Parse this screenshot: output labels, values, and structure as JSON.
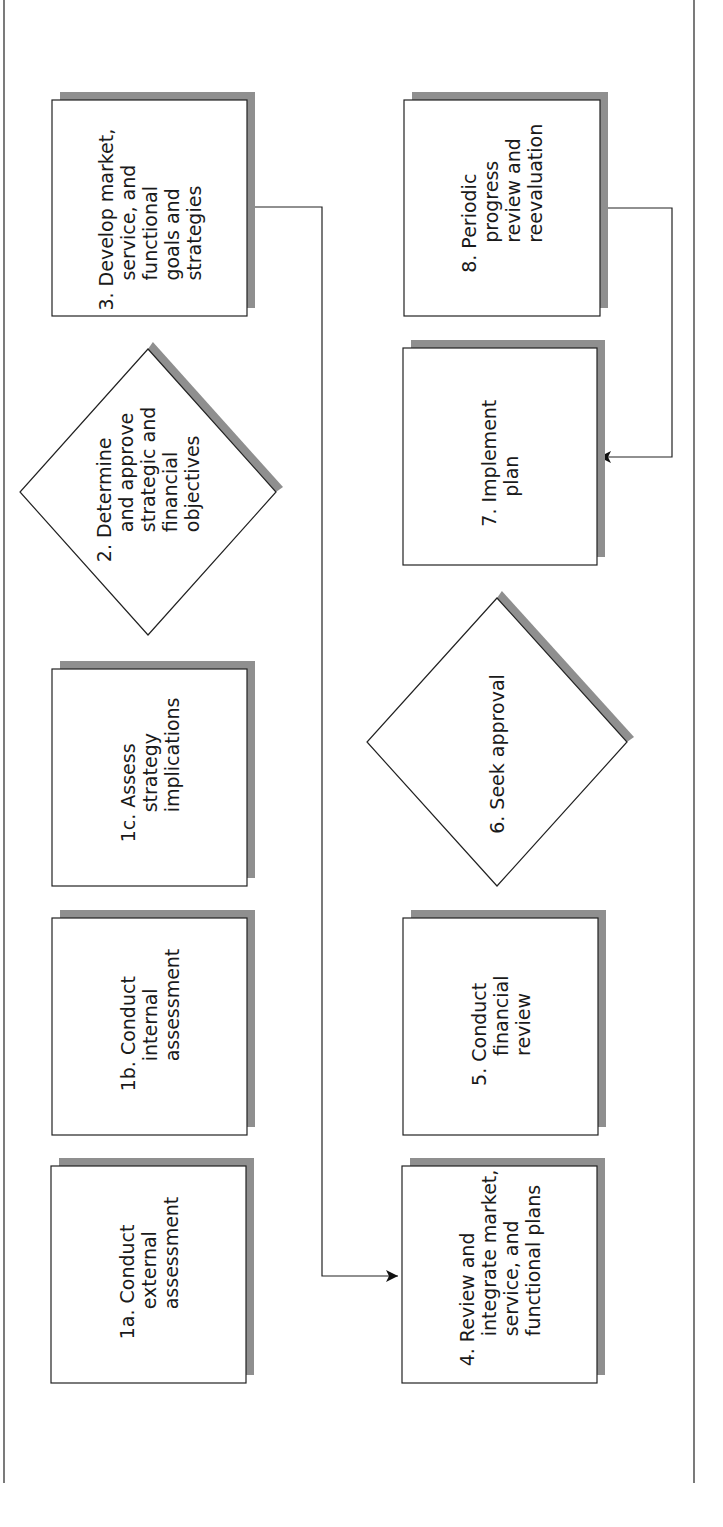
{
  "diagram": {
    "orientation": "rotated-90-ccw",
    "colors": {
      "line": "#222222",
      "shadow": "#8f8f8f",
      "fill": "#ffffff",
      "text": "#1a1a1a"
    },
    "frame": {
      "left_x": 4,
      "right_x": 694,
      "top_y": 0,
      "bottom_y": 1483
    },
    "nodes": [
      {
        "id": "1a",
        "shape": "box",
        "x": 51,
        "y": 1166,
        "w": 195,
        "h": 217,
        "lines": [
          "1a.  Conduct",
          "external",
          "assessment"
        ]
      },
      {
        "id": "1b",
        "shape": "box",
        "x": 52,
        "y": 918,
        "w": 195,
        "h": 217,
        "lines": [
          "1b.  Conduct",
          "internal",
          "assessment"
        ]
      },
      {
        "id": "1c",
        "shape": "box",
        "x": 52,
        "y": 669,
        "w": 195,
        "h": 217,
        "lines": [
          "1c.  Assess",
          "strategy",
          "implications"
        ]
      },
      {
        "id": "2",
        "shape": "diamond",
        "cx": 148,
        "cy": 492,
        "rx": 128,
        "ry": 143,
        "lines": [
          "2.  Determine",
          "and approve",
          "strategic and",
          "financial",
          "objectives"
        ]
      },
      {
        "id": "3",
        "shape": "box",
        "x": 52,
        "y": 100,
        "w": 195,
        "h": 216,
        "lines": [
          "3.  Develop market,",
          "service, and",
          "functional",
          "goals and",
          "strategies"
        ]
      },
      {
        "id": "4",
        "shape": "box",
        "x": 402,
        "y": 1166,
        "w": 195,
        "h": 217,
        "lines": [
          "4.  Review and",
          "integrate market,",
          "service, and",
          "functional plans"
        ]
      },
      {
        "id": "5",
        "shape": "box",
        "x": 403,
        "y": 918,
        "w": 195,
        "h": 217,
        "lines": [
          "5.  Conduct",
          "financial",
          "review"
        ]
      },
      {
        "id": "6",
        "shape": "diamond",
        "cx": 497,
        "cy": 742,
        "rx": 130,
        "ry": 144,
        "lines": [
          "6.  Seek approval"
        ]
      },
      {
        "id": "7",
        "shape": "box",
        "x": 403,
        "y": 348,
        "w": 194,
        "h": 217,
        "lines": [
          "7.  Implement",
          "plan"
        ]
      },
      {
        "id": "8",
        "shape": "box",
        "x": 404,
        "y": 100,
        "w": 196,
        "h": 216,
        "lines": [
          "8.  Periodic",
          "progress",
          "review and",
          "reevaluation"
        ]
      }
    ],
    "connectors": [
      {
        "from": "3",
        "to": "4",
        "points": [
          [
            247,
            207
          ],
          [
            322,
            207
          ],
          [
            322,
            1276
          ],
          [
            398,
            1276
          ]
        ]
      },
      {
        "from": "8",
        "to": "7",
        "points": [
          [
            600,
            208
          ],
          [
            672,
            208
          ],
          [
            672,
            457
          ],
          [
            599,
            457
          ]
        ]
      }
    ]
  }
}
